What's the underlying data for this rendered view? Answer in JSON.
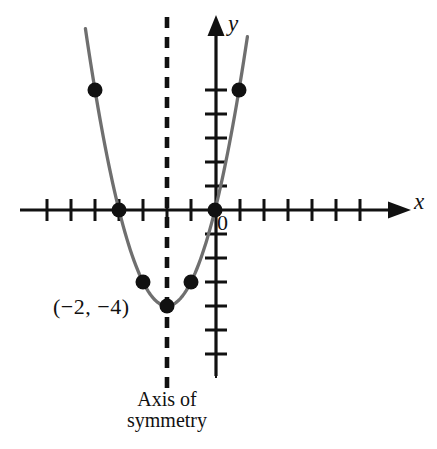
{
  "figure": {
    "background_color": "#ffffff"
  },
  "labels": {
    "y_axis": "y",
    "x_axis": "x",
    "origin": "0",
    "vertex": "(−2, −4)",
    "symmetry_line1": "Axis of",
    "symmetry_line2": "symmetry"
  },
  "colors": {
    "axis": "#111111",
    "curve": "#6f6f6f",
    "point": "#111111",
    "dashed_line": "#111111",
    "text": "#111111"
  },
  "chart_data": {
    "type": "line",
    "title": "",
    "subtitle": "",
    "xlabel": "x",
    "ylabel": "y",
    "equation": "y = (x + 2)^2 - 4",
    "vertex": [
      -2,
      -4
    ],
    "axis_of_symmetry_x": -2,
    "grid": false,
    "legend": "none",
    "xlim": [
      -8.2,
      7.9
    ],
    "ylim": [
      -7.8,
      8.0
    ],
    "x_ticks": [
      -8,
      -7,
      -6,
      -5,
      -4,
      -3,
      -2,
      -1,
      1,
      2,
      3,
      4,
      5,
      6,
      7
    ],
    "y_ticks": [
      -7,
      -6,
      -5,
      -4,
      -3,
      -2,
      -1,
      1,
      2,
      3,
      4,
      5
    ],
    "tick_labels_shown": [
      "0"
    ],
    "points": [
      {
        "x": -5,
        "y": 5
      },
      {
        "x": -4,
        "y": 0
      },
      {
        "x": -3,
        "y": -3
      },
      {
        "x": -2,
        "y": -4
      },
      {
        "x": -1,
        "y": -3
      },
      {
        "x": 0,
        "y": 0
      },
      {
        "x": 1,
        "y": 5
      }
    ],
    "curve_x_range": [
      -5.4,
      1.35
    ],
    "annotations": [
      {
        "text": "(−2, −4)",
        "x": -2,
        "y": -4,
        "position": "left"
      },
      {
        "text": "Axis of symmetry",
        "x": -2,
        "y": -7.9,
        "position": "below"
      }
    ]
  },
  "geometry": {
    "origin_px": [
      215,
      210
    ],
    "unit_px": 24,
    "x_axis": {
      "x1": 20,
      "x2": 392,
      "y": 210,
      "arrow_tip_x": 404
    },
    "y_axis": {
      "x": 216,
      "y1": 30,
      "y2": 376,
      "arrow_tip_y": 18
    },
    "tick_half_len": 11,
    "dashed_line": {
      "x": 167,
      "y1": 17,
      "y2": 392
    },
    "point_radius": 7.5
  }
}
